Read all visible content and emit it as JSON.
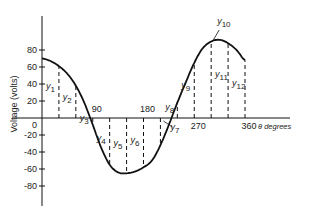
{
  "chart_data": {
    "type": "line",
    "title": "",
    "xlabel": "θ degrees",
    "ylabel": "Voltage (volts)",
    "xlim": [
      0,
      360
    ],
    "ylim": [
      -80,
      80
    ],
    "x_ticks": [
      "90",
      "180",
      "270",
      "360"
    ],
    "y_ticks": [
      "80",
      "60",
      "40",
      "20",
      "0",
      "-20",
      "-40",
      "-60",
      "-80"
    ],
    "grid": false,
    "legend": "none",
    "series": [
      {
        "name": "voltage waveform",
        "x": [
          0,
          15,
          30,
          45,
          60,
          75,
          90,
          105,
          120,
          135,
          150,
          165,
          180,
          195,
          210,
          225,
          240,
          255,
          270,
          285,
          300,
          315,
          330,
          345,
          360
        ],
        "values": [
          70,
          67,
          61,
          52,
          38,
          18,
          -8,
          -35,
          -55,
          -64,
          -65,
          -63,
          -58,
          -50,
          -32,
          -8,
          18,
          42,
          65,
          82,
          90,
          92,
          88,
          80,
          68
        ]
      }
    ],
    "ordinates": {
      "labels": [
        "y1",
        "y2",
        "y3",
        "y4",
        "y5",
        "y6",
        "y7",
        "y8",
        "y9",
        "y10",
        "y11",
        "y12"
      ],
      "x": [
        30,
        60,
        90,
        120,
        150,
        180,
        210,
        240,
        270,
        300,
        330,
        360
      ]
    }
  },
  "axis": {
    "ylabel": "Voltage (volts)",
    "xlabel": "θ degrees",
    "x_ticks": [
      "90",
      "180",
      "270",
      "360"
    ],
    "y_ticks": [
      "80",
      "60",
      "40",
      "20",
      "0",
      "-20",
      "-40",
      "-60",
      "-80"
    ]
  }
}
